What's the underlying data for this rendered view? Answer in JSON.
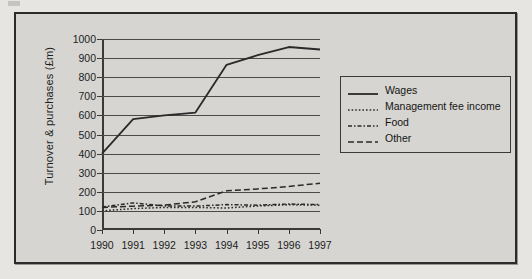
{
  "figure": {
    "background_color": "#d6d5d1",
    "border_color": "#2b2b2b"
  },
  "chart_data": {
    "type": "line",
    "title": "",
    "xlabel": "",
    "ylabel": "Turnover & purchases (£m)",
    "categories": [
      "1990",
      "1991",
      "1992",
      "1993",
      "1994",
      "1995",
      "1996",
      "1997"
    ],
    "x": [
      1990,
      1991,
      1992,
      1993,
      1994,
      1995,
      1996,
      1997
    ],
    "ylim": [
      0,
      1000
    ],
    "yticks": [
      0,
      100,
      200,
      300,
      400,
      500,
      600,
      700,
      800,
      900,
      1000
    ],
    "ytick_labels": [
      "0",
      "100",
      "200",
      "300",
      "400",
      "500",
      "600",
      "700",
      "800",
      "900",
      "1000"
    ],
    "grid": true,
    "grid_axis": "y",
    "legend_position": "right",
    "series": [
      {
        "name": "Wages",
        "style": "solid",
        "color": "#2a2a2a",
        "values": [
          400,
          580,
          600,
          615,
          865,
          915,
          958,
          945
        ]
      },
      {
        "name": "Management fee income",
        "style": "dotted",
        "color": "#2a2a2a",
        "values": [
          100,
          112,
          118,
          118,
          115,
          126,
          132,
          130
        ]
      },
      {
        "name": "Food",
        "style": "dashdot",
        "color": "#2a2a2a",
        "values": [
          120,
          142,
          126,
          125,
          133,
          130,
          136,
          133
        ]
      },
      {
        "name": "Other",
        "style": "dashed",
        "color": "#2a2a2a",
        "values": [
          118,
          125,
          130,
          148,
          205,
          215,
          228,
          245
        ]
      }
    ]
  },
  "legend": {
    "entries": [
      {
        "label": "Wages",
        "style": "solid"
      },
      {
        "label": "Management fee income",
        "style": "dotted"
      },
      {
        "label": "Food",
        "style": "dashdot"
      },
      {
        "label": "Other",
        "style": "dashed"
      }
    ]
  }
}
